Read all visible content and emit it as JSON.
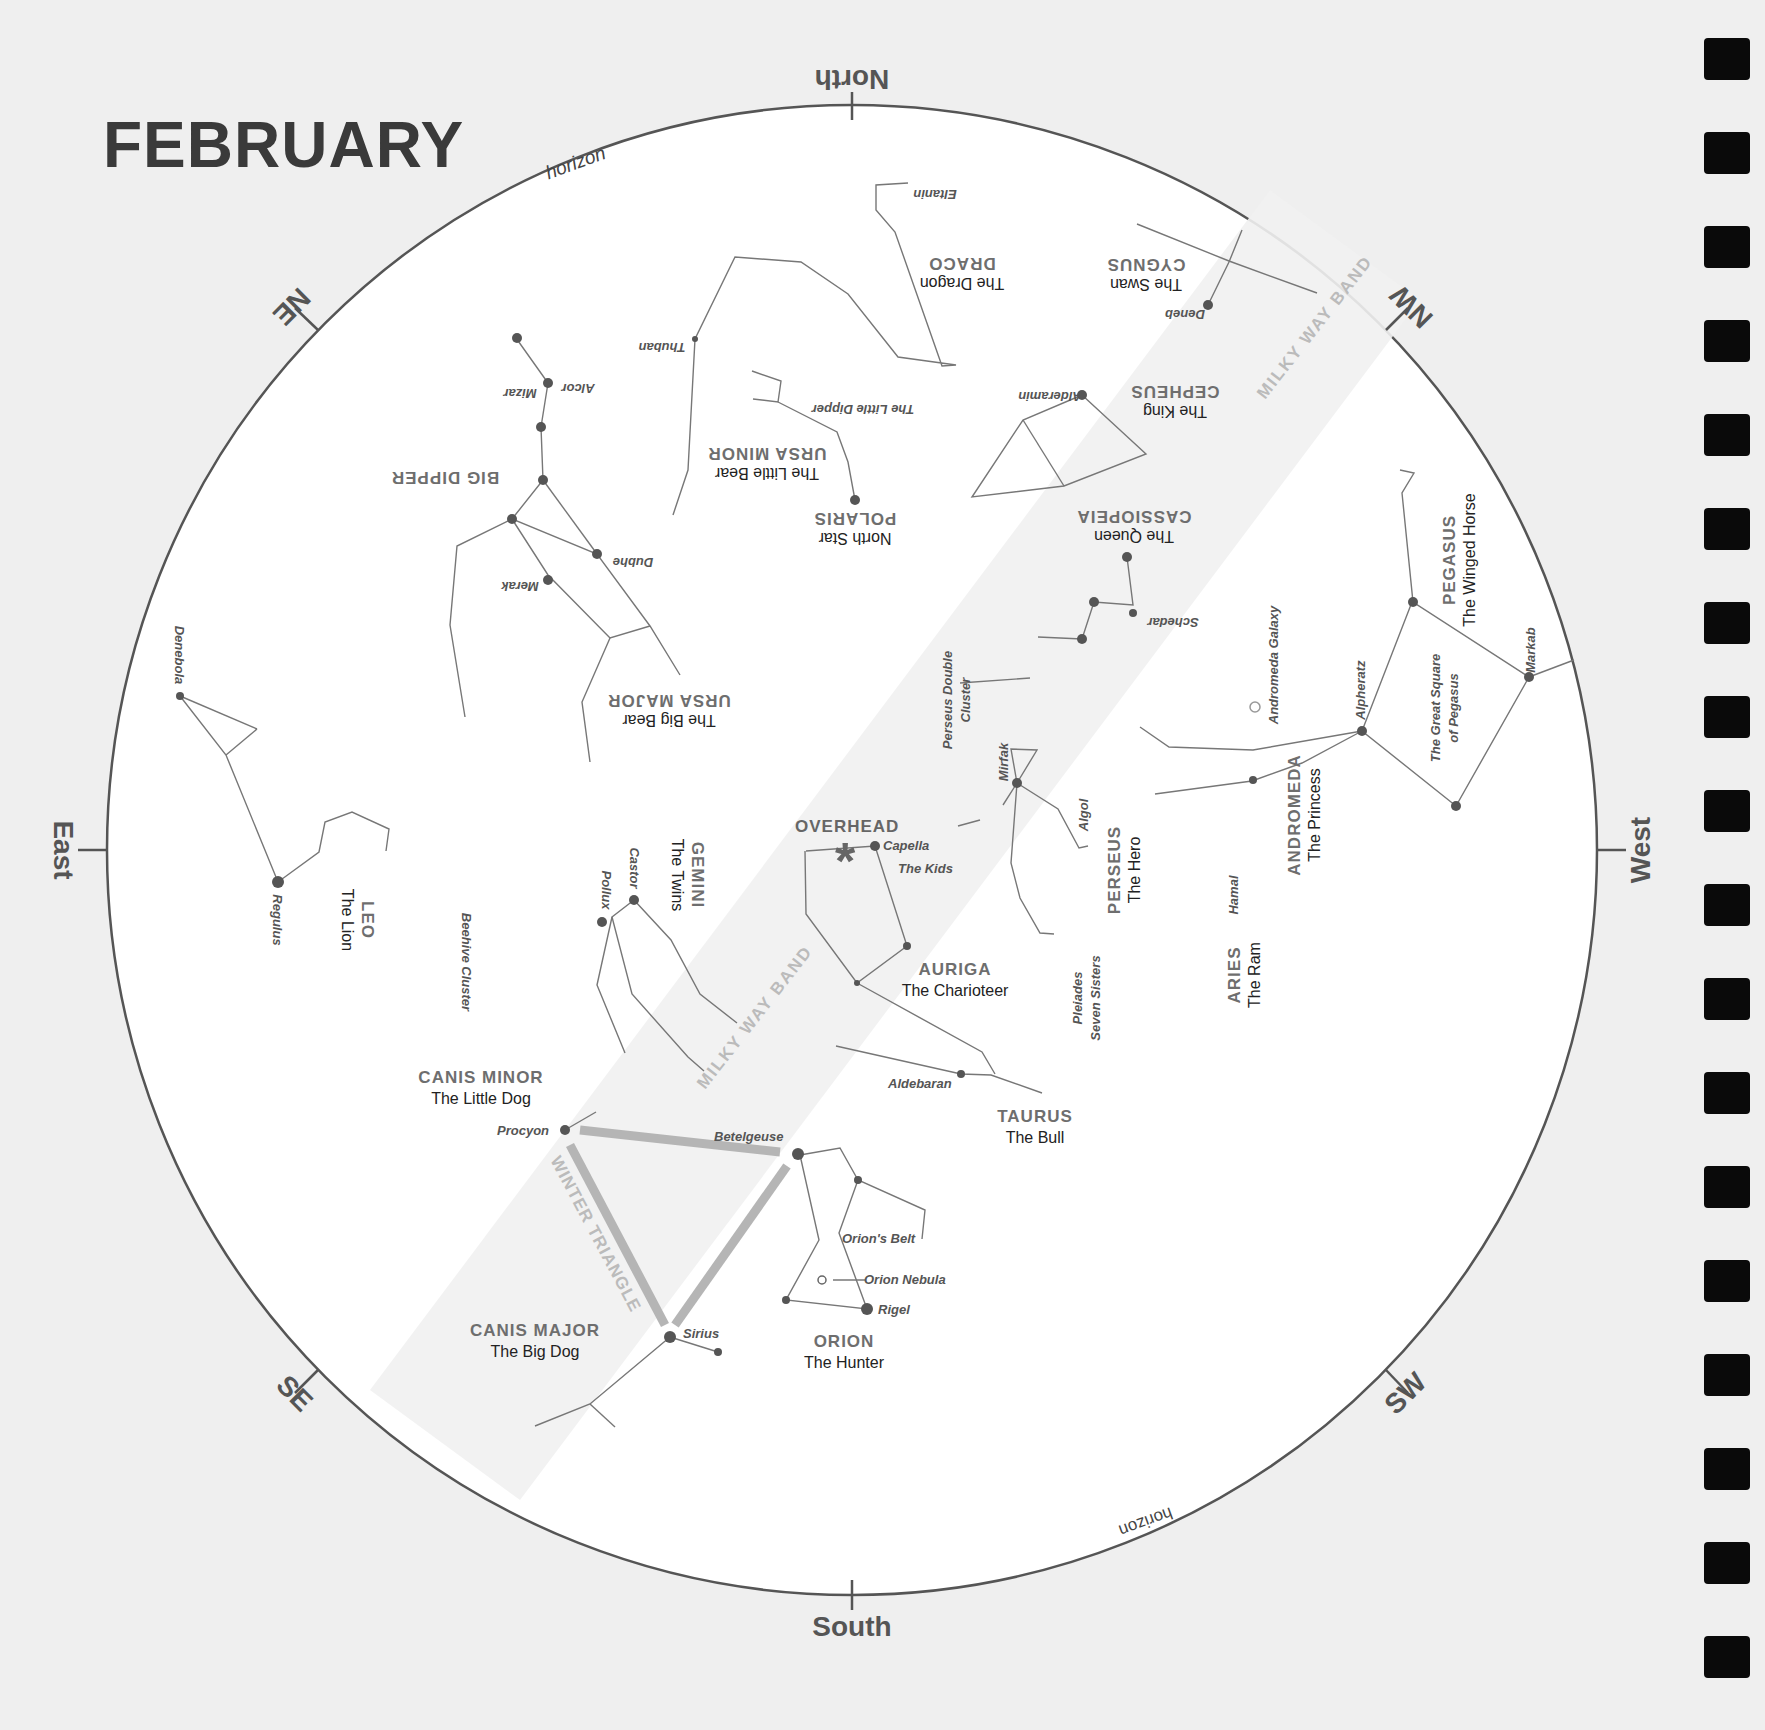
{
  "title": "FEBRUARY",
  "directions": {
    "north": "North",
    "south": "South",
    "east": "East",
    "west": "West",
    "ne": "NE",
    "nw": "NW",
    "se": "SE",
    "sw": "SW"
  },
  "horizon_label": "horizon",
  "overhead_label": "OVERHEAD",
  "milky_way_label": "MILKY WAY BAND",
  "winter_triangle_label": "WINTER TRIANGLE",
  "constellations": [
    {
      "name": "DRACO",
      "sub": "The Dragon"
    },
    {
      "name": "CYGNUS",
      "sub": "The Swan"
    },
    {
      "name": "CEPHEUS",
      "sub": "The King"
    },
    {
      "name": "URSA MINOR",
      "sub": "The Little Bear"
    },
    {
      "name": "POLARIS",
      "sub": "North Star"
    },
    {
      "name": "BIG DIPPER",
      "sub": ""
    },
    {
      "name": "URSA MAJOR",
      "sub": "The Big Bear"
    },
    {
      "name": "CASSIOPEIA",
      "sub": "The Queen"
    },
    {
      "name": "PEGASUS",
      "sub": "The Winged Horse"
    },
    {
      "name": "ANDROMEDA",
      "sub": "The Princess"
    },
    {
      "name": "PERSEUS",
      "sub": "The Hero"
    },
    {
      "name": "ARIES",
      "sub": "The Ram"
    },
    {
      "name": "LEO",
      "sub": "The Lion"
    },
    {
      "name": "GEMINI",
      "sub": "The Twins"
    },
    {
      "name": "AURIGA",
      "sub": "The Charioteer"
    },
    {
      "name": "TAURUS",
      "sub": "The Bull"
    },
    {
      "name": "CANIS MINOR",
      "sub": "The Little Dog"
    },
    {
      "name": "CANIS MAJOR",
      "sub": "The Big Dog"
    },
    {
      "name": "ORION",
      "sub": "The Hunter"
    }
  ],
  "stars": {
    "eltanin": "Eltanin",
    "thuban": "Thuban",
    "deneb": "Deneb",
    "alcor": "Alcor",
    "mizar": "Mizar",
    "little_dipper": "The Little Dipper",
    "alderamin": "Alderamin",
    "dubhe": "Dubhe",
    "merak": "Merak",
    "schedar": "Schedar",
    "andromeda_galaxy": "Andromeda Galaxy",
    "alpheratz": "Alpheratz",
    "great_square": "The Great Square",
    "great_square2": "of Pegasus",
    "markab": "Markab",
    "double_cluster": "Perseus Double",
    "double_cluster2": "Cluster",
    "mirfak": "Mirfak",
    "algol": "Algol",
    "denebola": "Denebola",
    "regulus": "Regulus",
    "beehive": "Beehive Cluster",
    "castor": "Castor",
    "pollux": "Pollux",
    "capella": "Capella",
    "the_kids": "The Kids",
    "hamal": "Hamal",
    "pleiades": "Pleiades",
    "seven_sisters": "Seven Sisters",
    "aldebaran": "Aldebaran",
    "procyon": "Procyon",
    "betelgeuse": "Betelgeuse",
    "orions_belt": "Orion's Belt",
    "orion_nebula": "Orion Nebula",
    "rigel": "Rigel",
    "sirius": "Sirius"
  }
}
